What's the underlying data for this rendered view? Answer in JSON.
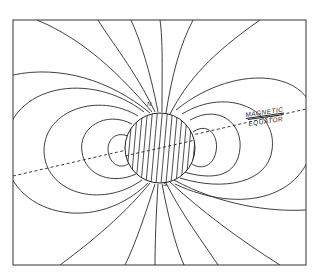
{
  "diagram": {
    "type": "magnetic-dipole-field-lines",
    "labels": {
      "magnetic": "MAGNETIC",
      "equator": "EQUATOR",
      "north": "N",
      "south": "S"
    },
    "colors": {
      "lines": "#2a2a2a",
      "background": "#ffffff"
    }
  }
}
